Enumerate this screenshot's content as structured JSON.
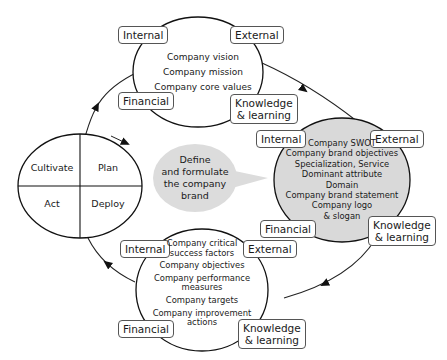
{
  "top_circle": {
    "items": [
      "Company vision",
      "Company mission",
      "Company core values"
    ],
    "labels": {
      "internal": "Internal",
      "external": "External",
      "financial": "Financial",
      "knowledge": [
        "Knowledge",
        "& learning"
      ]
    }
  },
  "right_circle": {
    "items": [
      "Company SWOT",
      "Company brand objectives",
      "Specialization, Service",
      "Dominant attribute",
      "Domain",
      "Company brand statement",
      "Company logo",
      "& slogan"
    ],
    "labels": {
      "internal": "Internal",
      "external": "External",
      "financial": "Financial",
      "knowledge": [
        "Knowledge",
        "& learning"
      ]
    },
    "fill": "#d9d9d9"
  },
  "bottom_circle": {
    "items": [
      "Company critical",
      "success factors",
      "Company objectives",
      "Company performance",
      "measures",
      "Company targets",
      "Company improvement",
      "actions"
    ],
    "labels": {
      "internal": "Internal",
      "external": "External",
      "financial": "Financial",
      "knowledge": [
        "Knowledge",
        "& learning"
      ]
    }
  },
  "cycle": {
    "quadrants": {
      "top_left": "Cultivate",
      "top_right": "Plan",
      "bottom_left": "Act",
      "bottom_right": "Deploy"
    }
  },
  "center_bubble": {
    "lines": [
      "Define",
      "and formulate",
      "the company",
      "brand"
    ],
    "fill": "#dcdcdc"
  }
}
